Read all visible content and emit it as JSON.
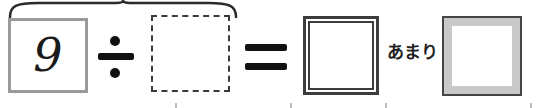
{
  "problem": {
    "type": "division-with-remainder",
    "expression": "9 ÷ ☐ = ☐ あまり ☐",
    "dividend": "9",
    "divisor_placeholder": "",
    "quotient_placeholder": "",
    "remainder_placeholder": "",
    "operators": {
      "divide": "÷",
      "equals": "="
    },
    "remainder_label": "あまり",
    "brace_label": ""
  },
  "colors": {
    "dividend_box_border": "#9a9a9a",
    "dashed_box_border": "#3a3a3a",
    "double_box_border": "#3c3c3c",
    "inset_box_border": "#444444",
    "inset_box_fill": "#c9c9c9",
    "ink": "#111111",
    "text": "#1f1f1f",
    "page_background": "#ffffff"
  },
  "marks": {
    "tick_positions": [
      175,
      290,
      385,
      530
    ]
  }
}
